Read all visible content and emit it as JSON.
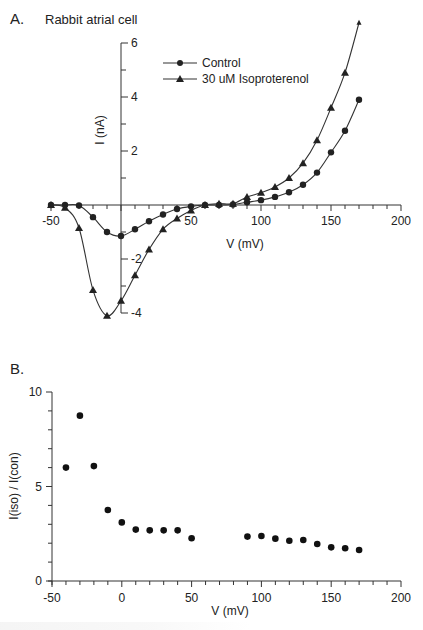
{
  "chart_data": [
    {
      "panel": "A.",
      "type": "line",
      "title": "Rabbit atrial cell",
      "xlabel": "V (mV)",
      "ylabel": "I (nA)",
      "xlim": [
        -50,
        200
      ],
      "ylim": [
        -4,
        6
      ],
      "x_ticks": [
        -50,
        0,
        50,
        100,
        150,
        200
      ],
      "x_tick_labels": [
        "-50",
        "",
        "50",
        "100",
        "150",
        "200"
      ],
      "y_ticks": [
        -4,
        -2,
        2,
        4,
        6
      ],
      "y_tick_labels": [
        "-4",
        "-2",
        "2",
        "4",
        "6"
      ],
      "y_axis_at_x": 0,
      "grid": false,
      "legend_position": "top-center",
      "series": [
        {
          "name": "Control",
          "marker": "circle",
          "x": [
            -50,
            -40,
            -30,
            -20,
            -10,
            0,
            10,
            20,
            30,
            40,
            50,
            60,
            70,
            80,
            90,
            100,
            110,
            120,
            130,
            140,
            150,
            160,
            170
          ],
          "values": [
            0,
            0,
            -0.02,
            -0.45,
            -1.0,
            -1.15,
            -0.9,
            -0.6,
            -0.35,
            -0.15,
            -0.05,
            0,
            0,
            0.02,
            0.1,
            0.18,
            0.3,
            0.47,
            0.75,
            1.2,
            1.95,
            2.75,
            3.9
          ]
        },
        {
          "name": "30 uM Isoproterenol",
          "marker": "triangle",
          "x": [
            -50,
            -40,
            -30,
            -20,
            -10,
            0,
            10,
            20,
            30,
            40,
            50,
            60,
            70,
            80,
            90,
            100,
            110,
            120,
            130,
            140,
            150,
            160,
            170
          ],
          "values": [
            0,
            -0.1,
            -0.85,
            -3.15,
            -4.1,
            -3.55,
            -2.6,
            -1.65,
            -0.9,
            -0.5,
            -0.2,
            0,
            0.05,
            0.05,
            0.3,
            0.45,
            0.67,
            1.0,
            1.55,
            2.4,
            3.6,
            4.9,
            6.75
          ]
        }
      ]
    },
    {
      "panel": "B.",
      "type": "scatter",
      "title": "",
      "xlabel": "V (mV)",
      "ylabel": "I(iso) / I(con)",
      "xlim": [
        -50,
        200
      ],
      "ylim": [
        0,
        10
      ],
      "x_ticks": [
        -50,
        0,
        50,
        100,
        150,
        200
      ],
      "x_tick_labels": [
        "-50",
        "0",
        "50",
        "100",
        "150",
        "200"
      ],
      "y_ticks": [
        0,
        5,
        10
      ],
      "y_tick_labels": [
        "0",
        "5",
        "10"
      ],
      "grid": false,
      "series": [
        {
          "name": "ratio",
          "marker": "circle",
          "x": [
            -40,
            -30,
            -20,
            -10,
            0,
            10,
            20,
            30,
            40,
            50,
            90,
            100,
            110,
            120,
            130,
            140,
            150,
            160,
            170
          ],
          "values": [
            6.0,
            8.75,
            6.08,
            3.76,
            3.1,
            2.72,
            2.68,
            2.68,
            2.68,
            2.26,
            2.35,
            2.38,
            2.24,
            2.13,
            2.17,
            1.96,
            1.78,
            1.73,
            1.64
          ]
        }
      ]
    }
  ]
}
